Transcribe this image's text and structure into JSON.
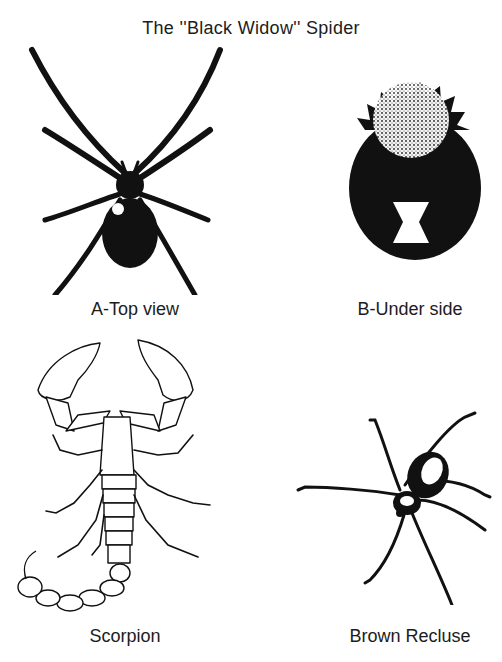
{
  "page": {
    "title": "The ''Black Widow'' Spider"
  },
  "figures": [
    {
      "id": "A",
      "label": "A-Top view",
      "subject": "black-widow-top-view"
    },
    {
      "id": "B",
      "label": "B-Under side",
      "subject": "black-widow-underside"
    },
    {
      "id": "C",
      "label": "Scorpion",
      "subject": "scorpion"
    },
    {
      "id": "D",
      "label": "Brown Recluse",
      "subject": "brown-recluse"
    }
  ],
  "colors": {
    "ink": "#111111",
    "paper": "#ffffff",
    "marking": "#ffffff"
  }
}
